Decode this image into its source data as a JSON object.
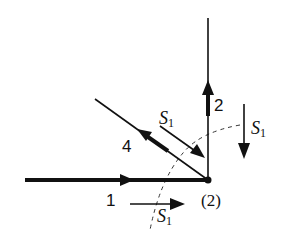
{
  "diagram": {
    "node": {
      "label": "(2)"
    },
    "members": [
      {
        "id": "1",
        "label": "1",
        "direction": "horizontal",
        "arrow": "toward-node"
      },
      {
        "id": "2",
        "label": "2",
        "direction": "vertical",
        "arrow": "away-from-node"
      },
      {
        "id": "4",
        "label": "4",
        "direction": "diagonal",
        "arrow": "away-from-node"
      }
    ],
    "forces": [
      {
        "id": "s1-diagonal",
        "symbol": "S",
        "subscript": "1",
        "direction": "down-right"
      },
      {
        "id": "s1-vertical",
        "symbol": "S",
        "subscript": "1",
        "direction": "down"
      },
      {
        "id": "s1-horizontal",
        "symbol": "S",
        "subscript": "1",
        "direction": "right"
      }
    ],
    "section_cut": {
      "style": "dashed-arc"
    }
  }
}
